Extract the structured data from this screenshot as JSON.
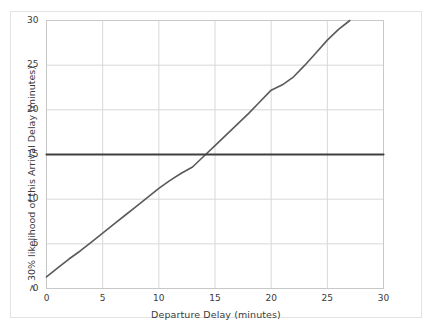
{
  "chart_data": {
    "type": "line",
    "title": "",
    "xlabel": "Departure Delay (minutes)",
    "ylabel": "> 30% likelihood of this Arrival Delay (minutes)",
    "xlim": [
      0,
      30
    ],
    "ylim": [
      0,
      30
    ],
    "xticks": [
      0,
      5,
      10,
      15,
      20,
      25,
      30
    ],
    "yticks": [
      0,
      5,
      10,
      15,
      20,
      25,
      30
    ],
    "xtick_labels": [
      "0",
      "5",
      "10",
      "15",
      "20",
      "25",
      "30"
    ],
    "ytick_labels": [
      "0",
      "5",
      "10",
      "15",
      "20",
      "25",
      "30"
    ],
    "grid": true,
    "legend": "none",
    "series": [
      {
        "name": "arrival-delay-threshold-curve",
        "color": "#5a5a5a",
        "linewidth": 1.6,
        "x": [
          0,
          1,
          2,
          3,
          4,
          5,
          6,
          7,
          8,
          9,
          10,
          11,
          12,
          13,
          14,
          15,
          16,
          17,
          18,
          19,
          20,
          21,
          22,
          23,
          24,
          25,
          26,
          27
        ],
        "y": [
          1.3,
          2.3,
          3.3,
          4.2,
          5.2,
          6.2,
          7.2,
          8.2,
          9.2,
          10.2,
          11.2,
          12.1,
          12.9,
          13.6,
          14.8,
          16.0,
          17.2,
          18.4,
          19.6,
          20.9,
          22.2,
          22.8,
          23.7,
          25.0,
          26.4,
          27.8,
          29.0,
          30.0
        ]
      },
      {
        "name": "reference-line-15-minutes",
        "color": "#3f3f3f",
        "linewidth": 2.1,
        "x": [
          0,
          30
        ],
        "y": [
          15,
          15
        ]
      }
    ],
    "colors": {
      "curve": "#5a5a5a",
      "reference": "#3f3f3f",
      "grid": "#d8d8d8",
      "axis_border": "#c8c8c8",
      "frame": "#e3e3e3",
      "background": "#ffffff",
      "text": "#3a3a3a"
    }
  },
  "axes": {
    "x_title": "Departure Delay (minutes)",
    "y_title": "> 30% likelihood of this Arrival Delay (minutes)",
    "x_tick_labels": [
      "0",
      "5",
      "10",
      "15",
      "20",
      "25",
      "30"
    ],
    "y_tick_labels": [
      "0",
      "5",
      "10",
      "15",
      "20",
      "25",
      "30"
    ]
  }
}
